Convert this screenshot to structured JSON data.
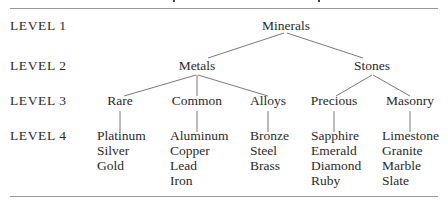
{
  "levels": [
    "LEVEL 1",
    "LEVEL 2",
    "LEVEL 3",
    "LEVEL 4"
  ],
  "tree": {
    "root": "Minerals",
    "level2": [
      "Metals",
      "Stones"
    ],
    "level3": [
      "Rare",
      "Common",
      "Alloys",
      "Precious",
      "Masonry"
    ],
    "level4": [
      [
        "Platinum",
        "Silver",
        "Gold"
      ],
      [
        "Aluminum",
        "Copper",
        "Lead",
        "Iron"
      ],
      [
        "Bronze",
        "Steel",
        "Brass"
      ],
      [
        "Sapphire",
        "Emerald",
        "Diamond",
        "Ruby"
      ],
      [
        "Limestone",
        "Granite",
        "Marble",
        "Slate"
      ]
    ]
  },
  "colors": {
    "text": "#2a2a2a",
    "edge": "#6a6a6a",
    "rule": "#9a9a9a"
  }
}
